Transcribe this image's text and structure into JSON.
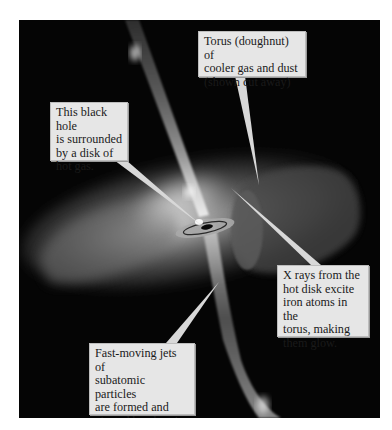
{
  "figure": {
    "callouts": {
      "black_hole": "This black hole\nis surrounded\nby a disk of\nhot gas.",
      "torus": "Torus (doughnut) of\ncooler gas and dust\n(shown cut away)",
      "xrays": "X rays from the\nhot disk excite\niron atoms in the\ntorus, making\nthem glow.",
      "jets": "Fast-moving jets of\nsubatomic particles\nare formed and\nejected by electric\nand magnetic fields."
    },
    "colors": {
      "background": "#050505",
      "callout_fill": "#e6e6e6",
      "pointer": "#d8d8d8",
      "gas": "#9a9a9a"
    }
  }
}
